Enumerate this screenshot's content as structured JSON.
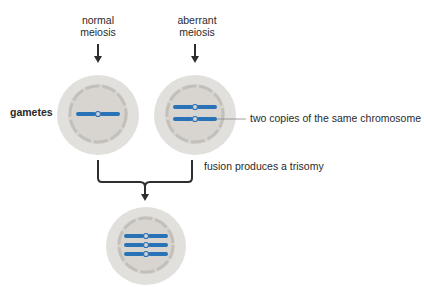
{
  "diagram": {
    "top_labels": {
      "normal": [
        "normal",
        "meiosis"
      ],
      "aberrant": [
        "aberrant",
        "meiosis"
      ]
    },
    "row_label": "gametes",
    "callouts": {
      "copies": "two copies of the same chromosome",
      "fusion": "fusion produces a trisomy"
    },
    "cells": [
      {
        "name": "normal-gamete",
        "chromosomes": 1
      },
      {
        "name": "aberrant-gamete",
        "chromosomes": 2
      },
      {
        "name": "trisomic-zygote",
        "chromosomes": 3
      }
    ],
    "colors": {
      "cell_outer": "#e2e0dc",
      "cell_inner": "#d6d3cf",
      "nuclear_ring": "#c3c0bb",
      "chromosome": "#2a72b8",
      "arrow": "#2e2e2e",
      "leader_line": "#888888"
    }
  }
}
